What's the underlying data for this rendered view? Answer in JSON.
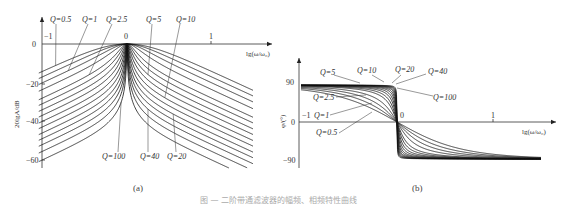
{
  "figure_caption": "图 — 二阶带通滤波器的幅频、相频特性曲线",
  "chart_data": [
    {
      "type": "line",
      "panel": "(a)",
      "title": "",
      "xlabel": "lg(ω/ω₀)",
      "ylabel": "20lg|A|/dB",
      "xlim": [
        -1,
        1.5
      ],
      "ylim": [
        -62,
        0
      ],
      "x_ticks": [
        "-1",
        "0",
        "1"
      ],
      "y_ticks": [
        "0",
        "−20",
        "−40",
        "−60"
      ],
      "grid": false,
      "formula": "20lg|A| = -10·lg(1 + Q²(ω/ω₀ − ω₀/ω)²)",
      "series": [
        {
          "name": "Q=0.5",
          "Q": 0.5
        },
        {
          "name": "Q=1",
          "Q": 1
        },
        {
          "name": "Q=2.5",
          "Q": 2.5
        },
        {
          "name": "Q=5",
          "Q": 5
        },
        {
          "name": "Q=10",
          "Q": 10
        },
        {
          "name": "Q=20",
          "Q": 20
        },
        {
          "name": "Q=40",
          "Q": 40
        },
        {
          "name": "Q=100",
          "Q": 100
        }
      ],
      "sample_points": {
        "x": [
          -1,
          -0.5,
          0,
          0.5,
          1
        ],
        "Q=0.5": [
          -13.9,
          -4.7,
          0,
          -4.7,
          -13.9
        ],
        "Q=1": [
          -19.9,
          -9.8,
          0,
          -9.8,
          -19.9
        ],
        "Q=10": [
          -39.9,
          -29.5,
          0,
          -29.5,
          -39.9
        ],
        "Q=100": [
          -59.9,
          -49.5,
          0,
          -49.5,
          -59.9
        ]
      },
      "annotations": [
        "Q=0.5",
        "Q=1",
        "Q=2.5",
        "Q=5",
        "Q=10",
        "Q=100",
        "Q=40",
        "Q=20"
      ]
    },
    {
      "type": "line",
      "panel": "(b)",
      "title": "",
      "xlabel": "lg(ω/ω₀)",
      "ylabel": "φ/(°)",
      "xlim": [
        -1,
        1.5
      ],
      "ylim": [
        -90,
        90
      ],
      "x_ticks": [
        "-1",
        "0",
        "1"
      ],
      "y_ticks": [
        "90",
        "0",
        "−90"
      ],
      "grid": false,
      "formula": "φ = −arctan(Q(ω/ω₀ − ω₀/ω))",
      "series": [
        {
          "name": "Q=0.5",
          "Q": 0.5
        },
        {
          "name": "Q=1",
          "Q": 1
        },
        {
          "name": "Q=2.5",
          "Q": 2.5
        },
        {
          "name": "Q=5",
          "Q": 5
        },
        {
          "name": "Q=10",
          "Q": 10
        },
        {
          "name": "Q=20",
          "Q": 20
        },
        {
          "name": "Q=40",
          "Q": 40
        },
        {
          "name": "Q=100",
          "Q": 100
        }
      ],
      "sample_points": {
        "x": [
          -1,
          -0.5,
          0,
          0.5,
          1
        ],
        "Q=0.5": [
          78.6,
          56.1,
          0,
          -56.1,
          -78.6
        ],
        "Q=1": [
          84.2,
          71.6,
          0,
          -71.6,
          -84.2
        ],
        "Q=10": [
          89.4,
          88.1,
          0,
          -88.1,
          -89.4
        ],
        "Q=100": [
          89.9,
          89.8,
          0,
          -89.8,
          -89.9
        ]
      },
      "annotations": [
        "Q=5",
        "Q=10",
        "Q=20",
        "Q=40",
        "Q=100",
        "Q=2.5",
        "Q=1",
        "Q=0.5"
      ]
    }
  ],
  "panels": {
    "a": {
      "caption": "(a)",
      "xlabel": "lg(ω/ω₀)",
      "ylabel": "20lgA/dB",
      "xticks": [
        "−1",
        "0",
        "1"
      ],
      "yticks": [
        "0",
        "−20",
        "−40",
        "−60"
      ],
      "labels": [
        "Q=0.5",
        "Q=1",
        "Q=2.5",
        "Q=5",
        "Q=10",
        "Q=100",
        "Q=40",
        "Q=20"
      ]
    },
    "b": {
      "caption": "(b)",
      "xlabel": "lg(ω/ω₀)",
      "ylabel": "φ/(°)",
      "xticks": [
        "−1",
        "0",
        "1"
      ],
      "yticks": [
        "90",
        "0",
        "−90"
      ],
      "labels": [
        "Q=5",
        "Q=10",
        "Q=20",
        "Q=40",
        "Q=100",
        "Q=2.5",
        "Q=1",
        "Q=0.5"
      ]
    }
  }
}
